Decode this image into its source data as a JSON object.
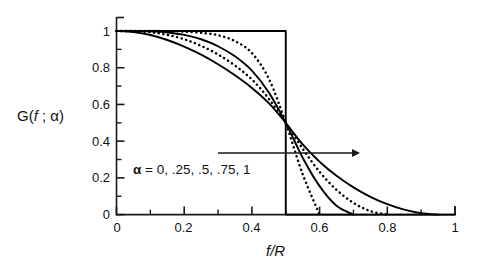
{
  "chart_data": {
    "type": "line",
    "title": "",
    "subtitle": "",
    "xlabel": "f/R",
    "ylabel": "G(f ; α)",
    "xlim": [
      0,
      1
    ],
    "ylim": [
      0,
      1
    ],
    "grid": false,
    "legend_position": "none",
    "xticks": [
      "0",
      "0.2",
      "0.4",
      "0.6",
      "0.8",
      "1"
    ],
    "xtick_values": [
      0,
      0.2,
      0.4,
      0.6,
      0.8,
      1
    ],
    "yticks": [
      "0",
      "0.2",
      "0.4",
      "0.6",
      "0.8",
      "1"
    ],
    "ytick_values": [
      0,
      0.2,
      0.4,
      0.6,
      0.8,
      1
    ],
    "minor_ticks": true,
    "annotations": [
      {
        "name": "alpha-family-label",
        "text": "α = 0, .25, .5, .75, 1",
        "x": 0.06,
        "y": 0.3
      },
      {
        "name": "direction-arrow",
        "text": "",
        "x_start": 0.3,
        "x_end": 0.715,
        "y": 0.315
      }
    ],
    "series": [
      {
        "name": "α = 0",
        "alpha": 0,
        "style": "solid",
        "color": "#000000",
        "description": "step function: G=1 for f/R<0.5, vertical drop at 0.5, G=0 for f/R>0.5",
        "x": [
          0,
          0.5,
          0.5,
          1
        ],
        "y": [
          1,
          1,
          0,
          0
        ]
      },
      {
        "name": "α = .25",
        "alpha": 0.25,
        "style": "dotted",
        "color": "#000000",
        "x": [
          0,
          0.05,
          0.1,
          0.15,
          0.2,
          0.25,
          0.3,
          0.35,
          0.4,
          0.45,
          0.5,
          0.55,
          0.6
        ],
        "y": [
          1,
          1.0,
          1.0,
          0.999,
          0.997,
          0.99,
          0.977,
          0.945,
          0.88,
          0.74,
          0.5,
          0.22,
          0.0
        ]
      },
      {
        "name": "α = .5",
        "alpha": 0.5,
        "style": "solid",
        "color": "#000000",
        "x": [
          0,
          0.05,
          0.1,
          0.15,
          0.2,
          0.25,
          0.3,
          0.35,
          0.4,
          0.45,
          0.5,
          0.55,
          0.6,
          0.65,
          0.7
        ],
        "y": [
          1,
          1.0,
          0.998,
          0.992,
          0.979,
          0.955,
          0.917,
          0.862,
          0.784,
          0.665,
          0.5,
          0.31,
          0.155,
          0.048,
          0.0
        ]
      },
      {
        "name": "α = .75",
        "alpha": 0.75,
        "style": "dotted",
        "color": "#000000",
        "x": [
          0,
          0.05,
          0.1,
          0.15,
          0.2,
          0.25,
          0.3,
          0.35,
          0.4,
          0.45,
          0.5,
          0.55,
          0.6,
          0.65,
          0.7,
          0.75,
          0.8
        ],
        "y": [
          1,
          0.999,
          0.993,
          0.979,
          0.955,
          0.919,
          0.872,
          0.812,
          0.736,
          0.631,
          0.5,
          0.359,
          0.233,
          0.135,
          0.064,
          0.019,
          0.0
        ]
      },
      {
        "name": "α = 1",
        "alpha": 1,
        "style": "solid",
        "color": "#000000",
        "x": [
          0,
          0.05,
          0.1,
          0.15,
          0.2,
          0.25,
          0.3,
          0.35,
          0.4,
          0.45,
          0.5,
          0.55,
          0.6,
          0.65,
          0.7,
          0.75,
          0.8,
          0.85,
          0.9,
          0.95
        ],
        "y": [
          1,
          0.994,
          0.978,
          0.951,
          0.915,
          0.871,
          0.819,
          0.759,
          0.69,
          0.607,
          0.5,
          0.382,
          0.288,
          0.211,
          0.148,
          0.097,
          0.057,
          0.027,
          0.008,
          0.0
        ]
      }
    ]
  },
  "axes": {
    "xlabel": "f/R",
    "ylabel_prefix": "G(",
    "ylabel_f": "f",
    "ylabel_mid": " ; ",
    "ylabel_alpha": "α",
    "ylabel_suffix": ")",
    "xlabel_f": "f",
    "xlabel_slash": "/",
    "xlabel_R": "R"
  },
  "annotation": {
    "alpha_symbol": "α",
    "alpha_values": " = 0, .25, .5, .75, 1"
  },
  "tick_labels": {
    "x": [
      "0",
      "0.2",
      "0.4",
      "0.6",
      "0.8",
      "1"
    ],
    "y": [
      "0",
      "0.2",
      "0.4",
      "0.6",
      "0.8",
      "1"
    ]
  },
  "colors": {
    "line": "#000000",
    "axis": "#1a1a1a",
    "background": "#ffffff"
  }
}
